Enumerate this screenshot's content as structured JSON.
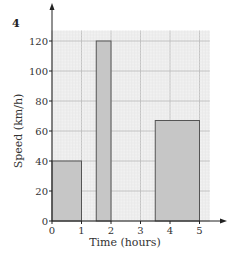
{
  "question_number": "4",
  "chart_data": {
    "type": "bar",
    "title": "",
    "xlabel": "Time (hours)",
    "ylabel": "Speed (km/h)",
    "xlim": [
      0,
      5
    ],
    "ylim": [
      0,
      120
    ],
    "x_ticks": [
      "0",
      "1",
      "2",
      "3",
      "4",
      "5"
    ],
    "y_ticks": [
      "0",
      "20",
      "40",
      "60",
      "80",
      "100",
      "120"
    ],
    "grid": true,
    "bars": [
      {
        "x_start": 0,
        "x_end": 1,
        "value": 40
      },
      {
        "x_start": 1.5,
        "x_end": 2,
        "value": 120
      },
      {
        "x_start": 3.5,
        "x_end": 5,
        "value": 67
      }
    ],
    "colors": {
      "bar_fill": "#c6c6c6",
      "bar_stroke": "#555555",
      "grid_major": "#bdbdbd",
      "grid_minor": "#e4e4e4",
      "plot_bg": "#f1f1f1"
    }
  }
}
